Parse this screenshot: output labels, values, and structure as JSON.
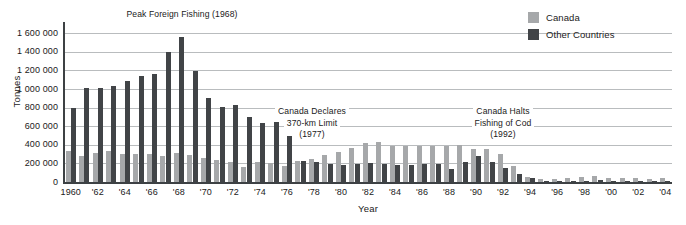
{
  "chart_data": {
    "type": "bar",
    "title": "",
    "xlabel": "Year",
    "ylabel": "Tonnes",
    "ylim": [
      0,
      1700000
    ],
    "ytick_values": [
      0,
      200000,
      400000,
      600000,
      800000,
      1000000,
      1200000,
      1400000,
      1600000
    ],
    "ytick_labels": [
      "0",
      "200 000",
      "400 000",
      "600 000",
      "800 000",
      "1 000 000",
      "1 200 000",
      "1 400 000",
      "1 600 000"
    ],
    "grid": true,
    "legend_position": "top-right",
    "categories": [
      1960,
      1961,
      1962,
      1963,
      1964,
      1965,
      1966,
      1967,
      1968,
      1969,
      1970,
      1971,
      1972,
      1973,
      1974,
      1975,
      1976,
      1977,
      1978,
      1979,
      1980,
      1981,
      1982,
      1983,
      1984,
      1985,
      1986,
      1987,
      1988,
      1989,
      1990,
      1991,
      1992,
      1993,
      1994,
      1995,
      1996,
      1997,
      1998,
      1999,
      2000,
      2001,
      2002,
      2003,
      2004
    ],
    "xtick_labels": [
      "1960",
      "'62",
      "'64",
      "'66",
      "'68",
      "'70",
      "'72",
      "'74",
      "'76",
      "'78",
      "'80",
      "'82",
      "'84",
      "'86",
      "'88",
      "'90",
      "'92",
      "'94",
      "'96",
      "'98",
      "'00",
      "'02",
      "'04"
    ],
    "xtick_years": [
      1960,
      1962,
      1964,
      1966,
      1968,
      1970,
      1972,
      1974,
      1976,
      1978,
      1980,
      1982,
      1984,
      1986,
      1988,
      1990,
      1992,
      1994,
      1996,
      1998,
      2000,
      2002,
      2004
    ],
    "series": [
      {
        "name": "Canada",
        "color": "#a6a8aa",
        "values": [
          330000,
          280000,
          315000,
          330000,
          305000,
          305000,
          300000,
          275000,
          315000,
          290000,
          255000,
          235000,
          210000,
          165000,
          215000,
          200000,
          175000,
          225000,
          250000,
          290000,
          325000,
          365000,
          420000,
          430000,
          390000,
          390000,
          385000,
          390000,
          385000,
          400000,
          360000,
          350000,
          300000,
          170000,
          55000,
          30000,
          28000,
          45000,
          55000,
          68000,
          45000,
          42000,
          40000,
          35000,
          38000
        ]
      },
      {
        "name": "Other Countries",
        "color": "#414447",
        "values": [
          800000,
          1015000,
          1015000,
          1035000,
          1085000,
          1145000,
          1165000,
          1400000,
          1555000,
          1195000,
          900000,
          810000,
          825000,
          700000,
          640000,
          645000,
          490000,
          230000,
          210000,
          195000,
          185000,
          190000,
          200000,
          195000,
          180000,
          185000,
          190000,
          195000,
          140000,
          210000,
          285000,
          215000,
          155000,
          90000,
          40000,
          12000,
          10000,
          12000,
          15000,
          17000,
          15000,
          13000,
          12000,
          11000,
          12000
        ]
      }
    ],
    "annotations": [
      {
        "lines": [
          "Peak Foreign Fishing (1968)"
        ],
        "x": 182,
        "y": 9
      },
      {
        "lines": [
          "Canada Declares",
          "370-km Limit",
          "(1977)"
        ],
        "x": 312,
        "y": 106
      },
      {
        "lines": [
          "Canada Halts",
          "Fishing of Cod",
          "(1992)"
        ],
        "x": 503,
        "y": 106
      }
    ]
  },
  "legend": {
    "items": [
      {
        "label": "Canada",
        "color": "#a6a8aa"
      },
      {
        "label": "Other Countries",
        "color": "#414447"
      }
    ]
  }
}
